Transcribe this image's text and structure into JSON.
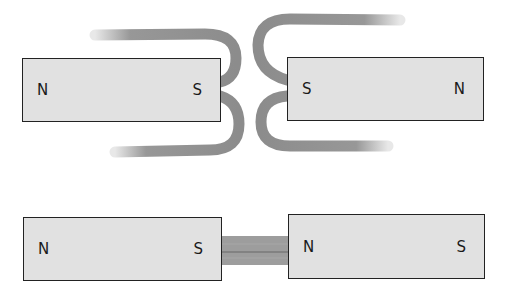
{
  "diagram": {
    "colors": {
      "magnet_fill": "#e1e1e1",
      "magnet_border": "#222222",
      "field_line": "#8c8c8c",
      "background": "#ffffff"
    },
    "top_row": {
      "left_magnet": {
        "left_pole": "N",
        "right_pole": "S"
      },
      "right_magnet": {
        "left_pole": "S",
        "right_pole": "N"
      },
      "interaction": "repulsion"
    },
    "bottom_row": {
      "left_magnet": {
        "left_pole": "N",
        "right_pole": "S"
      },
      "right_magnet": {
        "left_pole": "N",
        "right_pole": "S"
      },
      "interaction": "attraction"
    }
  }
}
